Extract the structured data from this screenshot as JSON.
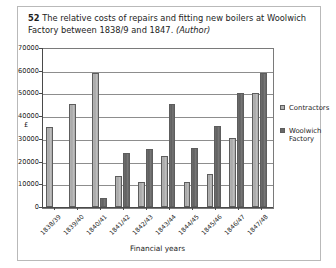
{
  "caption": {
    "figure_number": "52",
    "text": "The relative costs of repairs and fitting new boilers at Woolwich Factory between 1838/9 and 1847.",
    "source": "(Author)"
  },
  "legend": {
    "items": [
      {
        "label": "Contractors",
        "color": "#b0b0b0",
        "icon": "square-swatch-icon"
      },
      {
        "label": "Woolwich Factory",
        "color": "#686868",
        "icon": "square-swatch-icon"
      }
    ]
  },
  "axes": {
    "y_title": "£",
    "x_title": "Financial years",
    "y_ticks": [
      "0",
      "10000",
      "20000",
      "30000",
      "40000",
      "50000",
      "60000",
      "70000"
    ]
  },
  "chart_data": {
    "type": "bar",
    "title": "The relative costs of repairs and fitting new boilers at Woolwich Factory between 1838/9 and 1847.",
    "xlabel": "Financial years",
    "ylabel": "£",
    "ylim": [
      0,
      70000
    ],
    "ytick_step": 10000,
    "grid": true,
    "legend_position": "right",
    "categories": [
      "1838/39",
      "1839/40",
      "1840/41",
      "1841/42",
      "1842/43",
      "1843/44",
      "1844/45",
      "1845/46",
      "1846/47",
      "1847/48"
    ],
    "series": [
      {
        "name": "Contractors",
        "color": "#b0b0b0",
        "values": [
          35200,
          45400,
          59000,
          13600,
          11000,
          22500,
          11200,
          14500,
          30500,
          50000
        ]
      },
      {
        "name": "Woolwich Factory",
        "color": "#686868",
        "values": [
          0,
          0,
          3800,
          24000,
          25500,
          45500,
          26000,
          35500,
          50000,
          59000
        ]
      }
    ]
  }
}
